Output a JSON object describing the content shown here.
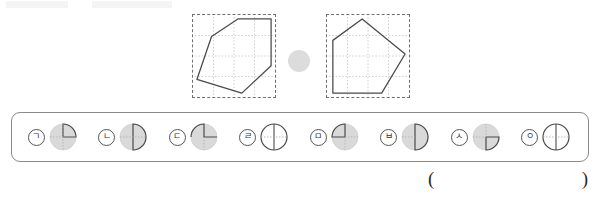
{
  "figures": {
    "left_shape": {
      "name": "pentagon-left",
      "points": "4,74 14,26 44,4 80,4 80,50 48,80",
      "grid_divisions": 4
    },
    "right_shape": {
      "name": "pentagon-right",
      "points": "6,80 6,26 34,4 80,38 54,80",
      "grid_divisions": 4
    },
    "separator": "dot-separator"
  },
  "choices": [
    {
      "marker": "ㄱ",
      "fraction_label": "quarter-upper-right",
      "sector_start": 270,
      "sector_end": 360,
      "diameters": [
        "vertical",
        "horizontal"
      ]
    },
    {
      "marker": "ㄴ",
      "fraction_label": "half-right",
      "sector_start": 270,
      "sector_end": 90,
      "diameters": [
        "horizontal"
      ]
    },
    {
      "marker": "ㄷ",
      "fraction_label": "three-quarter",
      "sector_start": 180,
      "sector_end": 90,
      "diameters": [
        "vertical",
        "horizontal"
      ]
    },
    {
      "marker": "ㄹ",
      "fraction_label": "quarters-cross",
      "sector_start": 0,
      "sector_end": 0,
      "diameters": [
        "vertical",
        "horizontal"
      ]
    },
    {
      "marker": "ㅁ",
      "fraction_label": "quarter-upper-left",
      "sector_start": 180,
      "sector_end": 270,
      "diameters": [
        "vertical",
        "horizontal"
      ]
    },
    {
      "marker": "ㅂ",
      "fraction_label": "half-right-vertical",
      "sector_start": 270,
      "sector_end": 90,
      "diameters": [
        "vertical"
      ]
    },
    {
      "marker": "ㅅ",
      "fraction_label": "quarter-right-lower",
      "sector_start": 0,
      "sector_end": 90,
      "diameters": [
        "vertical",
        "horizontal"
      ]
    },
    {
      "marker": "ㅇ",
      "fraction_label": "cross-quarters",
      "sector_start": 0,
      "sector_end": 0,
      "diameters": [
        "vertical",
        "horizontal"
      ]
    }
  ],
  "answer": {
    "open_paren": "(",
    "close_paren": ")",
    "value": ""
  },
  "colors": {
    "outline": "#555555",
    "shape_stroke": "#4a4a4a",
    "grid_dash": "#b9b9b9",
    "pie_fill": "#d9d9d9",
    "box_border": "#8a8a8a",
    "dot": "#dcdcdc"
  }
}
